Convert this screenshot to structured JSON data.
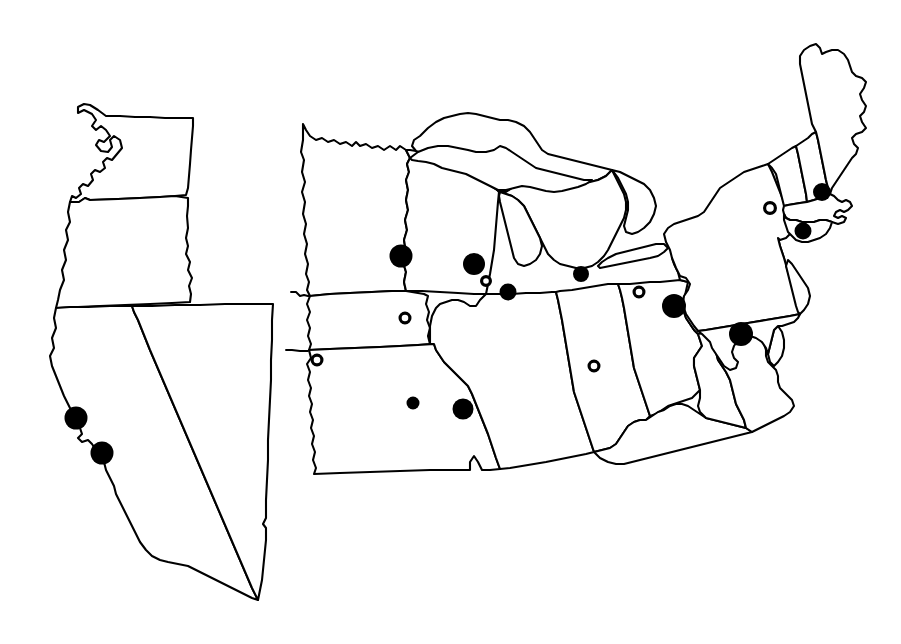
{
  "figure": {
    "background_color": "#ffffff",
    "line_color": "#000000",
    "marker_fill_color": "#000000",
    "marker_open_fill_color": "#ffffff",
    "width": 901,
    "height": 644
  },
  "legend": {
    "filled_marker_label": "filled circle",
    "open_marker_label": "open circle"
  },
  "panels": [
    {
      "id": "west-panel",
      "name": "Western United States",
      "states": [
        "Washington",
        "Oregon",
        "California",
        "Nevada"
      ]
    },
    {
      "id": "east-panel",
      "name": "Eastern and Midwestern United States",
      "states": [
        "Minnesota",
        "Iowa",
        "Missouri",
        "Wisconsin",
        "Illinois",
        "Michigan",
        "Indiana",
        "Kentucky",
        "Ohio",
        "Pennsylvania",
        "New York",
        "West Virginia",
        "Virginia",
        "Maryland",
        "Delaware",
        "New Jersey",
        "Connecticut",
        "Rhode Island",
        "Massachusetts",
        "Vermont",
        "New Hampshire",
        "Maine",
        "Nebraska",
        "Kansas"
      ],
      "lakes": [
        "Lake Superior",
        "Lake Michigan",
        "Lake Huron",
        "Lake Erie",
        "Lake Ontario"
      ]
    }
  ],
  "chart_data": {
    "type": "scatter",
    "xlabel": "",
    "ylabel": "",
    "xlim": [
      0,
      901
    ],
    "ylim": [
      0,
      644
    ],
    "grid": false,
    "legend_position": "none",
    "series": [
      {
        "name": "filled circle",
        "marker": "filled",
        "color": "#000000",
        "points": [
          {
            "label": "California Bay Area north",
            "x": 76,
            "y": 418,
            "r": 11.5
          },
          {
            "label": "California Bay Area south",
            "x": 102,
            "y": 453,
            "r": 11.5
          },
          {
            "label": "Minnesota Twin Cities",
            "x": 401,
            "y": 256,
            "r": 11.5
          },
          {
            "label": "Wisconsin Milwaukee",
            "x": 474,
            "y": 264,
            "r": 11.0
          },
          {
            "label": "Illinois Chicago",
            "x": 508,
            "y": 292,
            "r": 8.5
          },
          {
            "label": "Michigan southwest",
            "x": 581,
            "y": 274,
            "r": 8.0
          },
          {
            "label": "Pennsylvania central",
            "x": 674,
            "y": 306,
            "r": 12.0
          },
          {
            "label": "Maryland Chesapeake",
            "x": 741,
            "y": 334,
            "r": 12.0
          },
          {
            "label": "Massachusetts Boston",
            "x": 822,
            "y": 192,
            "r": 9.0
          },
          {
            "label": "Connecticut coastal",
            "x": 803,
            "y": 231,
            "r": 8.5
          },
          {
            "label": "Missouri central",
            "x": 413,
            "y": 403,
            "r": 6.5
          },
          {
            "label": "Missouri St. Louis",
            "x": 463,
            "y": 409,
            "r": 10.5
          }
        ]
      },
      {
        "name": "open circle",
        "marker": "open",
        "color": "#000000",
        "points": [
          {
            "label": "Nebraska eastern",
            "x": 317,
            "y": 360,
            "r": 6.5
          },
          {
            "label": "Iowa central",
            "x": 405,
            "y": 318,
            "r": 6.5
          },
          {
            "label": "Wisconsin southeast",
            "x": 486,
            "y": 281,
            "r": 6.0
          },
          {
            "label": "Indiana southern",
            "x": 594,
            "y": 366,
            "r": 6.5
          },
          {
            "label": "Ohio northeast",
            "x": 639,
            "y": 292,
            "r": 6.5
          },
          {
            "label": "New York eastern",
            "x": 770,
            "y": 208,
            "r": 7.0
          }
        ]
      }
    ],
    "counts": {
      "filled_circles": 12,
      "open_circles": 6,
      "total": 18
    }
  }
}
